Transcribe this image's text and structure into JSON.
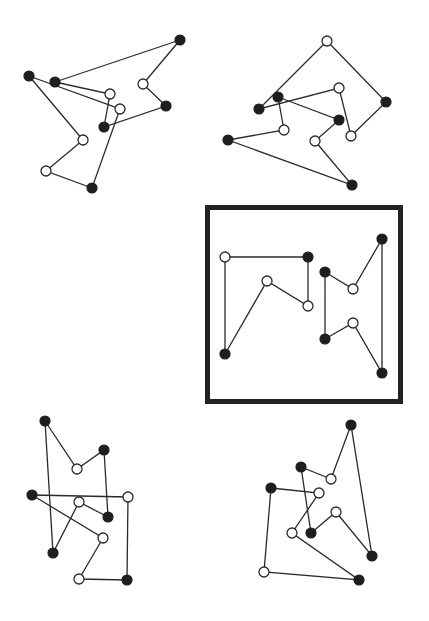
{
  "diagram": {
    "width": 429,
    "height": 621,
    "colors": {
      "background": "#ffffff",
      "ink": "#1e1e1e",
      "open_fill": "#ffffff"
    },
    "node_radius": 5,
    "highlight_frame": {
      "x": 207.5,
      "y": 207.5,
      "width": 193,
      "height": 194
    },
    "figures": [
      {
        "id": "top-left",
        "nodes": [
          {
            "x": 180,
            "y": 40,
            "filled": true
          },
          {
            "x": 29,
            "y": 76,
            "filled": true
          },
          {
            "x": 55,
            "y": 82,
            "filled": true
          },
          {
            "x": 143,
            "y": 84,
            "filled": false
          },
          {
            "x": 110,
            "y": 94,
            "filled": false
          },
          {
            "x": 166,
            "y": 106,
            "filled": true
          },
          {
            "x": 120,
            "y": 109,
            "filled": false
          },
          {
            "x": 104,
            "y": 127,
            "filled": true
          },
          {
            "x": 83,
            "y": 140,
            "filled": false
          },
          {
            "x": 46,
            "y": 171,
            "filled": false
          },
          {
            "x": 92,
            "y": 188,
            "filled": true
          }
        ],
        "polygons": [
          [
            [
              180,
              40
            ],
            [
              55,
              82
            ],
            [
              110,
              94
            ],
            [
              104,
              127
            ],
            [
              166,
              106
            ],
            [
              143,
              84
            ],
            [
              180,
              40
            ]
          ],
          [
            [
              29,
              76
            ],
            [
              120,
              109
            ],
            [
              92,
              188
            ],
            [
              46,
              171
            ],
            [
              83,
              140
            ],
            [
              29,
              76
            ]
          ]
        ]
      },
      {
        "id": "top-right",
        "nodes": [
          {
            "x": 327,
            "y": 41,
            "filled": false
          },
          {
            "x": 339,
            "y": 88,
            "filled": false
          },
          {
            "x": 278,
            "y": 97,
            "filled": true
          },
          {
            "x": 259,
            "y": 109,
            "filled": true
          },
          {
            "x": 386,
            "y": 102,
            "filled": true
          },
          {
            "x": 339,
            "y": 120,
            "filled": true
          },
          {
            "x": 284,
            "y": 130,
            "filled": false
          },
          {
            "x": 351,
            "y": 136,
            "filled": false
          },
          {
            "x": 315,
            "y": 141,
            "filled": false
          },
          {
            "x": 228,
            "y": 140,
            "filled": true
          },
          {
            "x": 352,
            "y": 185,
            "filled": true
          }
        ],
        "polygons": [
          [
            [
              327,
              41
            ],
            [
              259,
              109
            ],
            [
              339,
              88
            ],
            [
              351,
              136
            ],
            [
              386,
              102
            ],
            [
              327,
              41
            ]
          ],
          [
            [
              278,
              97
            ],
            [
              339,
              120
            ],
            [
              315,
              141
            ],
            [
              352,
              185
            ],
            [
              228,
              140
            ],
            [
              284,
              130
            ],
            [
              278,
              97
            ]
          ]
        ]
      },
      {
        "id": "center-highlighted",
        "nodes": [
          {
            "x": 225,
            "y": 257,
            "filled": false
          },
          {
            "x": 308,
            "y": 257,
            "filled": true
          },
          {
            "x": 267,
            "y": 281,
            "filled": false
          },
          {
            "x": 308,
            "y": 306,
            "filled": false
          },
          {
            "x": 225,
            "y": 354,
            "filled": true
          },
          {
            "x": 382,
            "y": 239,
            "filled": true
          },
          {
            "x": 325,
            "y": 272,
            "filled": true
          },
          {
            "x": 353,
            "y": 289,
            "filled": false
          },
          {
            "x": 353,
            "y": 323,
            "filled": false
          },
          {
            "x": 325,
            "y": 339,
            "filled": true
          },
          {
            "x": 382,
            "y": 373,
            "filled": true
          }
        ],
        "polygons": [
          [
            [
              225,
              354
            ],
            [
              225,
              257
            ],
            [
              308,
              257
            ],
            [
              308,
              306
            ],
            [
              267,
              281
            ],
            [
              225,
              354
            ]
          ],
          [
            [
              325,
              272
            ],
            [
              353,
              289
            ],
            [
              382,
              239
            ],
            [
              382,
              373
            ],
            [
              353,
              323
            ],
            [
              325,
              339
            ],
            [
              325,
              272
            ]
          ]
        ]
      },
      {
        "id": "bottom-left",
        "nodes": [
          {
            "x": 45,
            "y": 421,
            "filled": true
          },
          {
            "x": 104,
            "y": 450,
            "filled": true
          },
          {
            "x": 77,
            "y": 469,
            "filled": false
          },
          {
            "x": 32,
            "y": 495,
            "filled": true
          },
          {
            "x": 128,
            "y": 497,
            "filled": false
          },
          {
            "x": 79,
            "y": 502,
            "filled": false
          },
          {
            "x": 108,
            "y": 517,
            "filled": true
          },
          {
            "x": 103,
            "y": 538,
            "filled": false
          },
          {
            "x": 53,
            "y": 553,
            "filled": true
          },
          {
            "x": 79,
            "y": 579,
            "filled": false
          },
          {
            "x": 127,
            "y": 580,
            "filled": true
          }
        ],
        "polygons": [
          [
            [
              45,
              421
            ],
            [
              77,
              469
            ],
            [
              104,
              450
            ],
            [
              108,
              517
            ],
            [
              79,
              502
            ],
            [
              53,
              553
            ],
            [
              45,
              421
            ]
          ],
          [
            [
              32,
              495
            ],
            [
              128,
              497
            ],
            [
              127,
              580
            ],
            [
              79,
              579
            ],
            [
              103,
              538
            ],
            [
              32,
              495
            ]
          ]
        ]
      },
      {
        "id": "bottom-right",
        "nodes": [
          {
            "x": 351,
            "y": 425,
            "filled": true
          },
          {
            "x": 301,
            "y": 467,
            "filled": true
          },
          {
            "x": 331,
            "y": 479,
            "filled": false
          },
          {
            "x": 271,
            "y": 488,
            "filled": true
          },
          {
            "x": 319,
            "y": 493,
            "filled": false
          },
          {
            "x": 336,
            "y": 512,
            "filled": false
          },
          {
            "x": 311,
            "y": 533,
            "filled": true
          },
          {
            "x": 292,
            "y": 533,
            "filled": false
          },
          {
            "x": 372,
            "y": 556,
            "filled": true
          },
          {
            "x": 264,
            "y": 572,
            "filled": false
          },
          {
            "x": 359,
            "y": 580,
            "filled": true
          }
        ],
        "polygons": [
          [
            [
              351,
              425
            ],
            [
              331,
              479
            ],
            [
              301,
              467
            ],
            [
              311,
              533
            ],
            [
              336,
              512
            ],
            [
              372,
              556
            ],
            [
              351,
              425
            ]
          ],
          [
            [
              271,
              488
            ],
            [
              319,
              493
            ],
            [
              292,
              533
            ],
            [
              359,
              580
            ],
            [
              264,
              572
            ],
            [
              271,
              488
            ]
          ]
        ]
      }
    ]
  }
}
